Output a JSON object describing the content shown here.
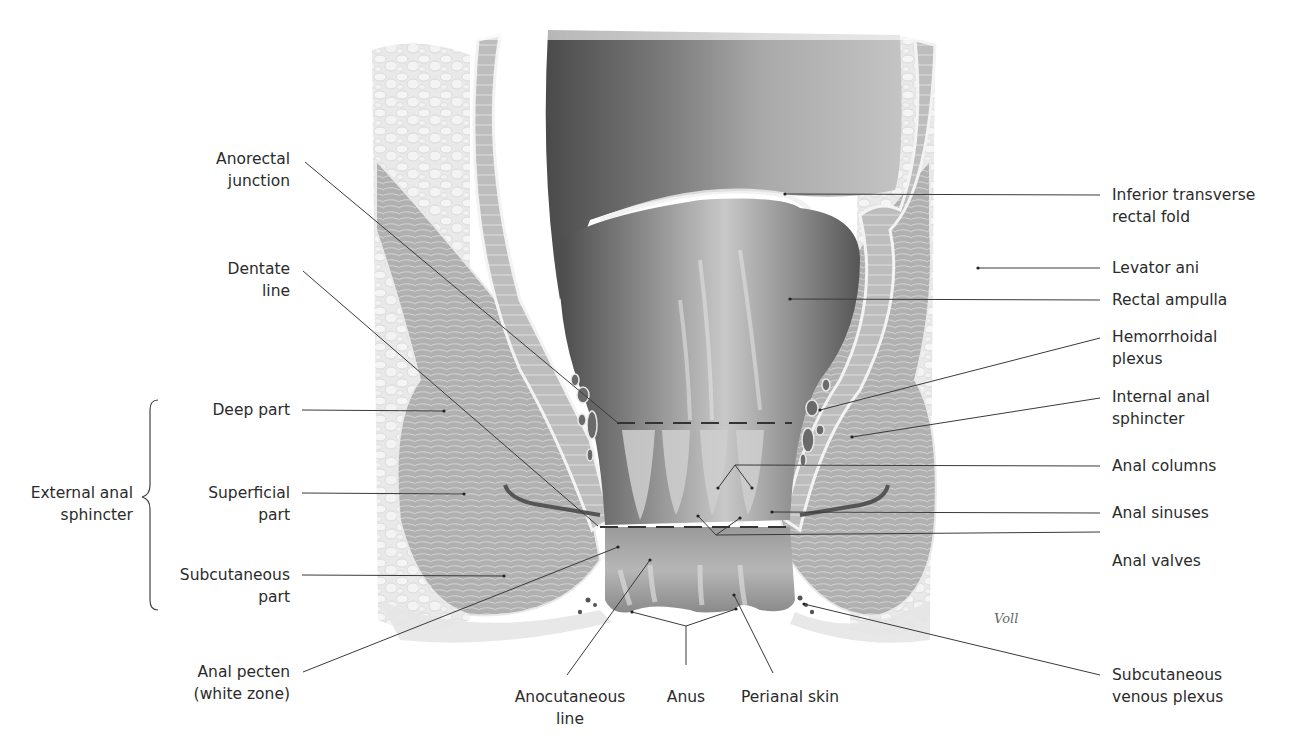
{
  "figure": {
    "signature": "Voll",
    "palette": {
      "background": "#ffffff",
      "lumen_dark": "#5a5a5a",
      "lumen_mid": "#8c8c8c",
      "mucosa_light": "#c9c9c9",
      "muscle": "#a9a9a9",
      "fat": "#e2e2e2",
      "line": "#333333"
    }
  },
  "labels_left": [
    {
      "id": "anorectal-junction",
      "lines": [
        "Anorectal",
        "junction"
      ]
    },
    {
      "id": "dentate-line",
      "lines": [
        "Dentate",
        "line"
      ]
    },
    {
      "id": "deep-part",
      "lines": [
        "Deep part"
      ]
    },
    {
      "id": "superficial-part",
      "lines": [
        "Superficial",
        "part"
      ]
    },
    {
      "id": "subcutaneous-part",
      "lines": [
        "Subcutaneous",
        "part"
      ]
    },
    {
      "id": "anal-pecten",
      "lines": [
        "Anal pecten",
        "(white zone)"
      ]
    }
  ],
  "group_label": {
    "id": "external-anal-sphincter",
    "lines": [
      "External anal",
      "sphincter"
    ]
  },
  "labels_bottom": [
    {
      "id": "anocutaneous-line",
      "lines": [
        "Anocutaneous",
        "line"
      ]
    },
    {
      "id": "anus",
      "lines": [
        "Anus"
      ]
    },
    {
      "id": "perianal-skin",
      "lines": [
        "Perianal skin"
      ]
    }
  ],
  "labels_right": [
    {
      "id": "inferior-transverse-rectal-fold",
      "lines": [
        "Inferior transverse",
        "rectal fold"
      ]
    },
    {
      "id": "levator-ani",
      "lines": [
        "Levator ani"
      ]
    },
    {
      "id": "rectal-ampulla",
      "lines": [
        "Rectal ampulla"
      ]
    },
    {
      "id": "hemorrhoidal-plexus",
      "lines": [
        "Hemorrhoidal",
        "plexus"
      ]
    },
    {
      "id": "internal-anal-sphincter",
      "lines": [
        "Internal anal",
        "sphincter"
      ]
    },
    {
      "id": "anal-columns",
      "lines": [
        "Anal columns"
      ]
    },
    {
      "id": "anal-sinuses",
      "lines": [
        "Anal sinuses"
      ]
    },
    {
      "id": "anal-valves",
      "lines": [
        "Anal valves"
      ]
    },
    {
      "id": "subcutaneous-venous-plexus",
      "lines": [
        "Subcutaneous",
        "venous plexus"
      ]
    }
  ]
}
